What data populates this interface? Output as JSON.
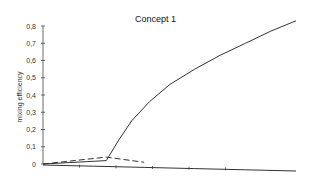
{
  "chart_data": {
    "type": "line",
    "title": "Concept 1",
    "xlabel": "",
    "ylabel": "mixing efficiency",
    "ylim": [
      0,
      0.8
    ],
    "yticks": [
      "0",
      "0,1",
      "0,2",
      "0,3",
      "0,4",
      "0,5",
      "0,6",
      "0,7",
      "0,8"
    ],
    "xticks_count": 6,
    "grid": false,
    "legend": "none",
    "series": [
      {
        "name": "solid-rising",
        "style": "solid",
        "x": [
          0,
          0.25,
          0.3,
          0.35,
          0.42,
          0.5,
          0.6,
          0.7,
          0.8,
          0.9,
          1.0
        ],
        "y": [
          0.0,
          0.02,
          0.14,
          0.25,
          0.36,
          0.46,
          0.55,
          0.63,
          0.7,
          0.77,
          0.83
        ]
      },
      {
        "name": "dashed",
        "style": "dashed",
        "x": [
          0,
          0.25,
          0.4
        ],
        "y": [
          0.0,
          0.04,
          0.01
        ]
      },
      {
        "name": "solid-declining",
        "style": "solid",
        "x": [
          0,
          0.2,
          0.4,
          0.6,
          0.8,
          1.0
        ],
        "y": [
          0.01,
          0.005,
          -0.005,
          -0.01,
          -0.012,
          -0.015
        ]
      }
    ]
  }
}
